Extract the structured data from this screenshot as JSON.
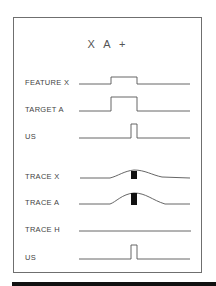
{
  "title": "X  A  +",
  "rows": [
    {
      "id": "feature-x",
      "label": "FEATURE X",
      "kind": "step"
    },
    {
      "id": "target-a",
      "label": "TARGET A",
      "kind": "step"
    },
    {
      "id": "us-1",
      "label": "US",
      "kind": "pulse"
    },
    {
      "id": "trace-x",
      "label": "TRACE X",
      "kind": "trace"
    },
    {
      "id": "trace-a",
      "label": "TRACE A",
      "kind": "trace"
    },
    {
      "id": "trace-h",
      "label": "TRACE H",
      "kind": "flat"
    },
    {
      "id": "us-2",
      "label": "US",
      "kind": "pulse"
    }
  ],
  "colors": {
    "line": "#555555",
    "marker": "#111111",
    "frame": "#6f6f6f",
    "bar": "#111111"
  }
}
